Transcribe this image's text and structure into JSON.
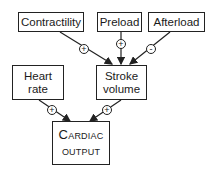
{
  "diagram": {
    "nodes": {
      "contractility": "Contractility",
      "preload": "Preload",
      "afterload": "Afterload",
      "heart_rate_line1": "Heart",
      "heart_rate_line2": "rate",
      "stroke_volume_line1": "Stroke",
      "stroke_volume_line2": "volume",
      "cardiac_output_line1": "Cardiac",
      "cardiac_output_line2": "output"
    },
    "edges": [
      {
        "from": "Contractility",
        "to": "Stroke volume",
        "sign": "+"
      },
      {
        "from": "Preload",
        "to": "Stroke volume",
        "sign": "+"
      },
      {
        "from": "Afterload",
        "to": "Stroke volume",
        "sign": "-"
      },
      {
        "from": "Heart rate",
        "to": "Cardiac output",
        "sign": "+"
      },
      {
        "from": "Stroke volume",
        "to": "Cardiac output",
        "sign": "+"
      }
    ],
    "signs": {
      "contractility": "+",
      "preload": "+",
      "afterload": "-",
      "heart_rate": "+",
      "stroke_volume": "+"
    }
  }
}
